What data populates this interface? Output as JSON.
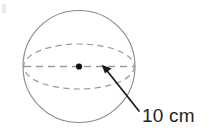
{
  "figure": {
    "background_color": "#ffffff",
    "outline_color": "#8a8a8a",
    "dash_color": "#9a9a9a",
    "arrow_color": "#1a1a1a",
    "center_dot_color": "#111111",
    "label_color": "#1f1f1f"
  },
  "shape": {
    "name": "sphere",
    "outline": {
      "name": "sphere-outline-circle",
      "center_x": 79,
      "center_y": 66.5,
      "radius": 56,
      "stroke_width": 1.1
    },
    "equator": {
      "name": "equator-ellipse",
      "center_x": 79,
      "center_y": 66.5,
      "rx": 56,
      "ry": 22.5,
      "stroke_width": 1.2,
      "dash_pattern": "6,4.5",
      "style": "dashed"
    },
    "diameter_line": {
      "name": "horizontal-diameter-line",
      "x1": 23,
      "y1": 66.5,
      "x2": 135,
      "y2": 66.5,
      "stroke_width": 1.2,
      "dash_pattern": "7,5",
      "style": "dashed"
    },
    "center_point": {
      "name": "center-point-dot",
      "cx": 79,
      "cy": 66.5,
      "r": 3.1
    }
  },
  "annotation": {
    "name": "radius-callout",
    "arrow": {
      "name": "radius-arrow",
      "tail_x": 139,
      "tail_y": 111,
      "tip_x": 102,
      "tip_y": 65,
      "stroke_width": 1.7,
      "head_length": 14,
      "head_width": 9
    },
    "label": {
      "text": "10 cm",
      "value": 10,
      "unit": "cm",
      "quantity": "radius",
      "font_size": 19
    }
  }
}
